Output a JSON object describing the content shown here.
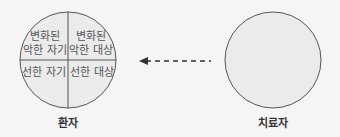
{
  "patient": {
    "label": "환자",
    "quadrants": {
      "top_left": [
        "변화된",
        "악한 자기"
      ],
      "top_right": [
        "변화된",
        "악한 대상"
      ],
      "bottom_left": "선한 자기",
      "bottom_right": "선한 대상"
    }
  },
  "therapist": {
    "label": "치료자"
  },
  "arrow": {
    "direction": "therapist-to-patient",
    "style": "dashed"
  },
  "colors": {
    "fill": "#ebebeb",
    "stroke": "#555555",
    "background": "#f5f5f5"
  }
}
